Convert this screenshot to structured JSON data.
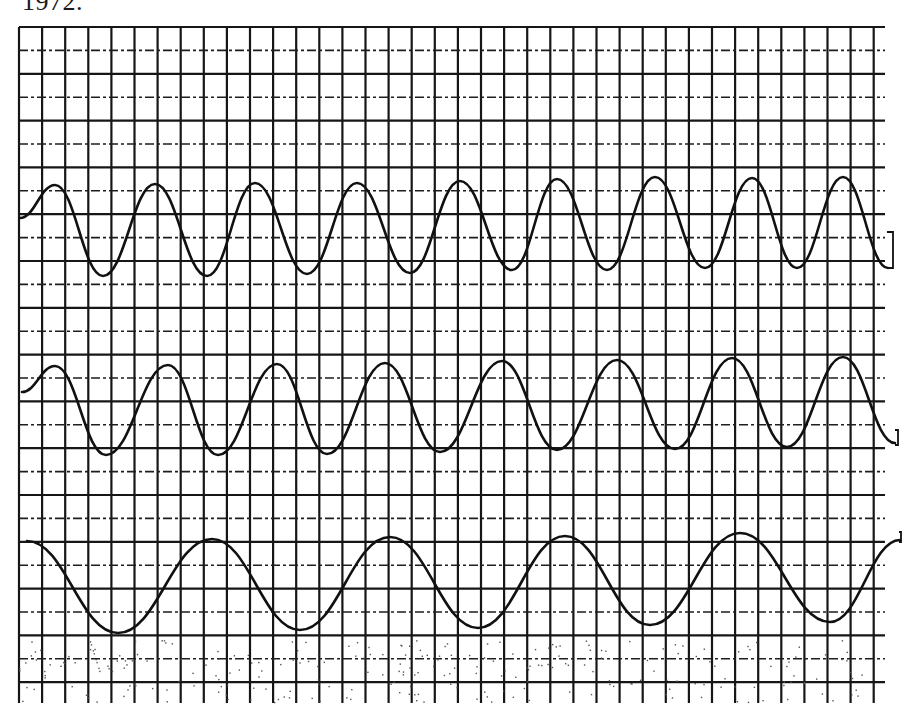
{
  "header": {
    "year_text": "1972."
  },
  "colors": {
    "paper": "#ffffff",
    "ink": "#111111",
    "grid": "#161616"
  },
  "grid": {
    "left": 19,
    "top": 27,
    "right": 885,
    "bottom": 703,
    "cell_w": 23.1,
    "cell_h": 23.4,
    "horizontal_style": "alternating solid / dash-dot"
  },
  "chart_data": {
    "type": "line",
    "title": "1972.",
    "xlabel": "",
    "ylabel": "",
    "grid": true,
    "legend": null,
    "units": "pixel coordinates on chart-recorder paper (y grows downward)",
    "series": [
      {
        "name": "trace-1 (top)",
        "description": "9 cycles, higher frequency",
        "extrema": [
          {
            "x": 20,
            "y": 218
          },
          {
            "x": 55,
            "y": 185
          },
          {
            "x": 103,
            "y": 276
          },
          {
            "x": 155,
            "y": 184
          },
          {
            "x": 207,
            "y": 276
          },
          {
            "x": 255,
            "y": 183
          },
          {
            "x": 307,
            "y": 274
          },
          {
            "x": 357,
            "y": 183
          },
          {
            "x": 410,
            "y": 273
          },
          {
            "x": 460,
            "y": 181
          },
          {
            "x": 512,
            "y": 270
          },
          {
            "x": 557,
            "y": 179
          },
          {
            "x": 607,
            "y": 270
          },
          {
            "x": 655,
            "y": 177
          },
          {
            "x": 705,
            "y": 268
          },
          {
            "x": 752,
            "y": 178
          },
          {
            "x": 797,
            "y": 268
          },
          {
            "x": 843,
            "y": 177
          },
          {
            "x": 888,
            "y": 268
          }
        ],
        "end_marker": {
          "x": 887,
          "y": 232,
          "w": 6,
          "h": 36
        }
      },
      {
        "name": "trace-2 (middle)",
        "description": "8 cycles, medium frequency",
        "extrema": [
          {
            "x": 22,
            "y": 392
          },
          {
            "x": 55,
            "y": 366
          },
          {
            "x": 106,
            "y": 455
          },
          {
            "x": 168,
            "y": 365
          },
          {
            "x": 218,
            "y": 455
          },
          {
            "x": 277,
            "y": 364
          },
          {
            "x": 327,
            "y": 454
          },
          {
            "x": 385,
            "y": 363
          },
          {
            "x": 440,
            "y": 452
          },
          {
            "x": 502,
            "y": 361
          },
          {
            "x": 557,
            "y": 450
          },
          {
            "x": 617,
            "y": 360
          },
          {
            "x": 675,
            "y": 449
          },
          {
            "x": 732,
            "y": 358
          },
          {
            "x": 787,
            "y": 447
          },
          {
            "x": 843,
            "y": 357
          },
          {
            "x": 895,
            "y": 443
          }
        ],
        "end_marker": {
          "x": 895,
          "y": 430,
          "w": 3,
          "h": 15
        }
      },
      {
        "name": "trace-3 (bottom)",
        "description": "5 cycles, low frequency",
        "extrema": [
          {
            "x": 27,
            "y": 541
          },
          {
            "x": 118,
            "y": 633
          },
          {
            "x": 212,
            "y": 539
          },
          {
            "x": 300,
            "y": 630
          },
          {
            "x": 390,
            "y": 537
          },
          {
            "x": 478,
            "y": 628
          },
          {
            "x": 565,
            "y": 536
          },
          {
            "x": 650,
            "y": 625
          },
          {
            "x": 740,
            "y": 533
          },
          {
            "x": 830,
            "y": 622
          },
          {
            "x": 900,
            "y": 540
          }
        ],
        "end_marker": {
          "x": 899,
          "y": 532,
          "w": 2,
          "h": 10
        }
      }
    ]
  }
}
